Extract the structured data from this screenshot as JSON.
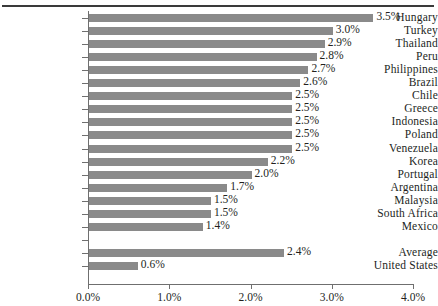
{
  "chart_data": {
    "type": "bar",
    "orientation": "horizontal",
    "title": "",
    "subtitle": "",
    "xlabel": "",
    "ylabel": "",
    "xlim": [
      0.0,
      4.0
    ],
    "xticks": [
      "0.0%",
      "1.0%",
      "2.0%",
      "3.0%",
      "4.0%"
    ],
    "xtick_values": [
      0.0,
      1.0,
      2.0,
      3.0,
      4.0
    ],
    "grid": false,
    "legend": null,
    "bar_color": "#8a8a8a",
    "axis_color": "#6f6f6f",
    "text_color": "#231f1d",
    "categories": [
      "Hungary",
      "Turkey",
      "Thailand",
      "Peru",
      "Philippines",
      "Brazil",
      "Chile",
      "Greece",
      "Indonesia",
      "Poland",
      "Venezuela",
      "Korea",
      "Portugal",
      "Argentina",
      "Malaysia",
      "South  Africa",
      "Mexico",
      "",
      "Average",
      "United States"
    ],
    "values": [
      3.5,
      3.0,
      2.9,
      2.8,
      2.7,
      2.6,
      2.5,
      2.5,
      2.5,
      2.5,
      2.5,
      2.2,
      2.0,
      1.7,
      1.5,
      1.5,
      1.4,
      null,
      2.4,
      0.6
    ],
    "value_labels": [
      "3.5%",
      "3.0%",
      "2.9%",
      "2.8%",
      "2.7%",
      "2.6%",
      "2.5%",
      "2.5%",
      "2.5%",
      "2.5%",
      "2.5%",
      "2.2%",
      "2.0%",
      "1.7%",
      "1.5%",
      "1.5%",
      "1.4%",
      "",
      "2.4%",
      "0.6%"
    ]
  }
}
